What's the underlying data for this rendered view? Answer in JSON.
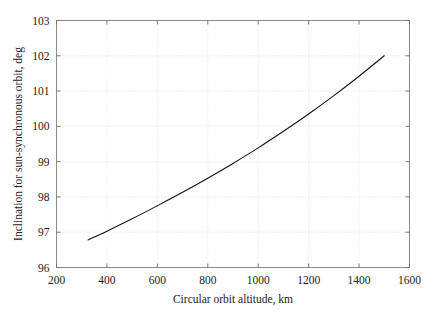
{
  "chart_data": {
    "type": "line",
    "title": "",
    "xlabel": "Circular orbit altitude, km",
    "ylabel": "Inclination for sun-synchronous orbit, deg",
    "xlim": [
      200,
      1600
    ],
    "ylim": [
      96,
      103
    ],
    "xticks": [
      200,
      400,
      600,
      800,
      1000,
      1200,
      1400,
      1600
    ],
    "xtick_labels": [
      "200",
      "400",
      "600",
      "800",
      "1000",
      "1200",
      "1400",
      "1600"
    ],
    "yticks": [
      96,
      97,
      98,
      99,
      100,
      101,
      102,
      103
    ],
    "ytick_labels": [
      "96",
      "97",
      "98",
      "99",
      "100",
      "101",
      "102",
      "103"
    ],
    "grid": true,
    "grid_style": "dotted",
    "grid_color": "#d8d8d8",
    "legend": null,
    "line_color": "#121212",
    "line_width": 1.1,
    "frame_color": "#8a8a8a",
    "background": "#ffffff",
    "series": [
      {
        "name": "Sun-synchronous inclination",
        "x": [
          325,
          400,
          500,
          600,
          700,
          800,
          900,
          1000,
          1100,
          1200,
          1300,
          1400,
          1500
        ],
        "y": [
          96.78,
          97.03,
          97.38,
          97.75,
          98.13,
          98.53,
          98.95,
          99.39,
          99.86,
          100.35,
          100.87,
          101.42,
          102.0
        ]
      }
    ]
  }
}
